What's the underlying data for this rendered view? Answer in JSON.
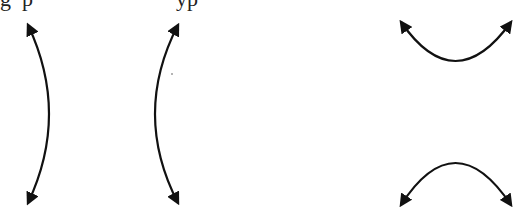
{
  "caption_fragment": "g  p                          yp",
  "diagram": {
    "figures": [
      {
        "name": "horizontal-hyperbola",
        "description": "Left-right opening branches",
        "stroke": "#111111"
      },
      {
        "name": "vertical-hyperbola",
        "description": "Up-down opening branches",
        "stroke": "#111111"
      }
    ]
  }
}
